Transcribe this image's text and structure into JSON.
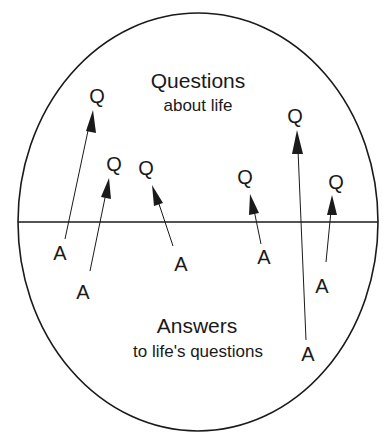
{
  "diagram": {
    "colors": {
      "stroke": "#1a1a1a",
      "background": "#ffffff"
    },
    "ellipse": {
      "cx": 198,
      "cy": 222,
      "rx": 180,
      "ry": 209
    },
    "divider": {
      "y": 222,
      "x1": 18,
      "x2": 378
    },
    "top_region": {
      "title": "Questions",
      "subtitle": "about life"
    },
    "bottom_region": {
      "title": "Answers",
      "subtitle": "to life's questions"
    },
    "question_label": "Q",
    "answer_label": "A",
    "pairs": [
      {
        "q": [
          92,
          94
        ],
        "a": [
          60,
          252
        ]
      },
      {
        "q": [
          114,
          164
        ],
        "a": [
          84,
          291
        ]
      },
      {
        "q": [
          146,
          167
        ],
        "a": [
          181,
          263
        ]
      },
      {
        "q": [
          244,
          178
        ],
        "a": [
          263,
          257
        ]
      },
      {
        "q": [
          295,
          115
        ],
        "a": [
          309,
          355
        ]
      },
      {
        "q": [
          336,
          183
        ],
        "a": [
          322,
          286
        ]
      }
    ]
  }
}
